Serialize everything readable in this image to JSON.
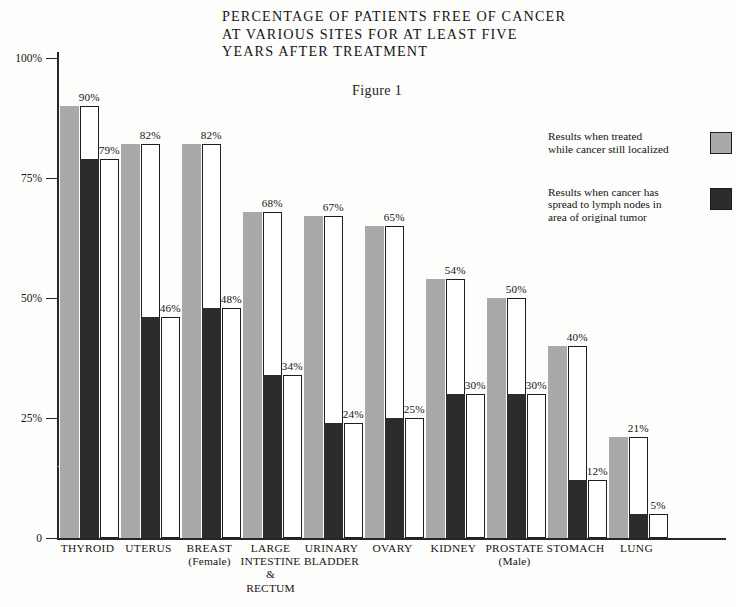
{
  "title": {
    "lines": [
      "PERCENTAGE OF PATIENTS FREE OF CANCER",
      "AT VARIOUS SITES FOR AT LEAST FIVE",
      "YEARS AFTER TREATMENT"
    ]
  },
  "figure_caption": "Figure 1",
  "legend": {
    "items": [
      {
        "lines": [
          "Results when treated",
          "while cancer still localized"
        ],
        "color": "#a9a9a9"
      },
      {
        "lines": [
          "Results when cancer has",
          "spread to lymph nodes in",
          "area of original tumor"
        ],
        "color": "#2c2c2c"
      }
    ]
  },
  "chart_data": {
    "type": "bar",
    "title": "PERCENTAGE OF PATIENTS FREE OF CANCER AT VARIOUS SITES FOR AT LEAST FIVE YEARS AFTER TREATMENT",
    "subtitle": "Figure 1",
    "xlabel": "",
    "ylabel": "",
    "ylim": [
      0,
      100
    ],
    "ytick_labels": [
      "100%",
      "75%",
      "50%",
      "25%",
      "0"
    ],
    "ytick_values": [
      100,
      75,
      50,
      25,
      0
    ],
    "grid": false,
    "legend_position": "right",
    "categories": [
      "THYROID",
      "UTERUS",
      "BREAST (Female)",
      "LARGE INTESTINE & RECTUM",
      "URINARY BLADDER",
      "OVARY",
      "KIDNEY",
      "PROSTATE (Male)",
      "STOMACH",
      "LUNG"
    ],
    "category_lines": [
      [
        "THYROID"
      ],
      [
        "UTERUS"
      ],
      [
        "BREAST",
        "(Female)"
      ],
      [
        "LARGE",
        "INTESTINE",
        "&",
        "RECTUM"
      ],
      [
        "URINARY",
        "BLADDER"
      ],
      [
        "OVARY"
      ],
      [
        "KIDNEY"
      ],
      [
        "PROSTATE",
        "(Male)"
      ],
      [
        "STOMACH"
      ],
      [
        "LUNG"
      ]
    ],
    "series": [
      {
        "name": "Results when treated while cancer still localized",
        "color": "#a9a9a9",
        "values": [
          90,
          82,
          82,
          68,
          67,
          65,
          54,
          50,
          40,
          21
        ]
      },
      {
        "name": "Results when cancer has spread to lymph nodes in area of original tumor",
        "color": "#2c2c2c",
        "values": [
          79,
          46,
          48,
          34,
          24,
          25,
          30,
          30,
          12,
          5
        ]
      }
    ],
    "value_labels": {
      "localized": [
        "90%",
        "82%",
        "82%",
        "68%",
        "67%",
        "65%",
        "54%",
        "50%",
        "40%",
        "21%"
      ],
      "spread": [
        "79%",
        "46%",
        "48%",
        "34%",
        "24%",
        "25%",
        "30%",
        "30%",
        "12%",
        "5%"
      ]
    }
  }
}
